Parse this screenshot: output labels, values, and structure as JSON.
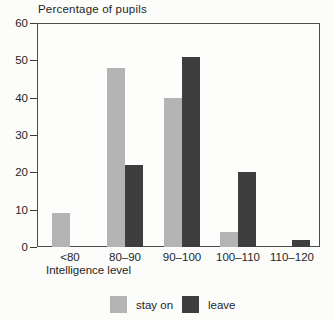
{
  "title": "Percentage of pupils",
  "x_axis": {
    "title": "Intelligence level",
    "tick_labels": [
      "<80",
      "80–90",
      "90–100",
      "100–110",
      "110–120"
    ]
  },
  "y_axis": {
    "ticks": [
      60,
      50,
      40,
      30,
      20,
      10,
      0
    ]
  },
  "legend": {
    "items": [
      {
        "label": "stay on",
        "color": "#b4b4b4"
      },
      {
        "label": "leave",
        "color": "#3e3e3e"
      }
    ],
    "position": "bottom"
  },
  "chart_data": {
    "type": "bar",
    "title": "Percentage of pupils",
    "xlabel": "Intelligence level",
    "ylabel": "Percentage of pupils",
    "categories": [
      "<80",
      "80–90",
      "90–100",
      "100–110",
      "110–120"
    ],
    "series": [
      {
        "name": "stay on",
        "color": "#b4b4b4",
        "values": [
          9,
          48,
          40,
          4,
          0
        ]
      },
      {
        "name": "leave",
        "color": "#3e3e3e",
        "values": [
          0,
          22,
          51,
          20,
          2
        ]
      }
    ],
    "ylim": [
      0,
      60
    ],
    "y_tick_step": 10,
    "grid": false,
    "legend_position": "bottom"
  }
}
